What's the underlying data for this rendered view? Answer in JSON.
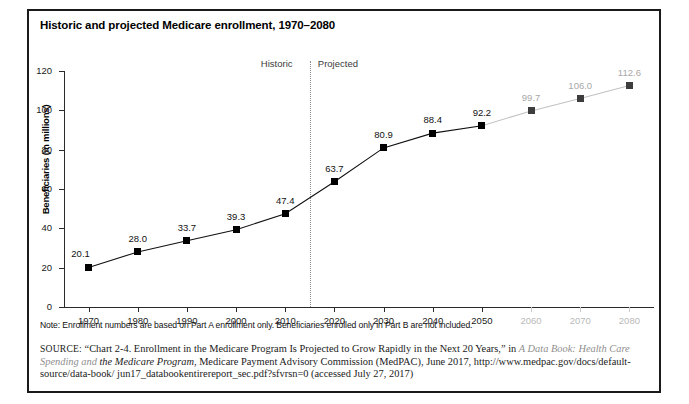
{
  "figure": {
    "title": "Historic and projected Medicare enrollment, 1970–2080",
    "note": "Note: Enrollment numbers are based on Part A enrollment only. Beneficiaries enrolled only in Part B are not included.",
    "source": {
      "label": "SOURCE:",
      "line1": "“Chart 2-4. Enrollment in the Medicare Program Is Projected to Grow Rapidly in the Next 20 Years,” in",
      "italic1": "A Data Book: Health Care Spending and",
      "italic2": "the Medicare Program",
      "line2": ", Medicare Payment Advisory Commission (MedPAC), June 2017, http://www.medpac.gov/docs/default-source/data-book/",
      "line3": "jun17_databookentirereport_sec.pdf?sfvrsn=0 (accessed July 27, 2017)"
    }
  },
  "annotations": {
    "historic": "Historic",
    "projected": "Projected",
    "divider_year": 2015
  },
  "chart_data": {
    "type": "line",
    "title": "Historic and projected Medicare enrollment, 1970–2080",
    "xlabel": "",
    "ylabel": "Beneficiaries (in millions)",
    "xlim": [
      1965,
      2085
    ],
    "ylim": [
      0,
      120
    ],
    "grid": false,
    "legend": "none",
    "xticks": [
      1970,
      1980,
      1990,
      2000,
      2010,
      2020,
      2030,
      2040,
      2050,
      2060,
      2070,
      2080
    ],
    "xticklabels": [
      "1970",
      "1980",
      "1990",
      "2000",
      "2010",
      "2020",
      "2030",
      "2040",
      "2050",
      "2060",
      "2070",
      "2080"
    ],
    "yticks": [
      0,
      20,
      40,
      60,
      80,
      100,
      120
    ],
    "yticklabels": [
      "0",
      "20",
      "40",
      "60",
      "80",
      "100",
      "120"
    ],
    "x": [
      1970,
      1980,
      1990,
      2000,
      2010,
      2020,
      2030,
      2040,
      2050,
      2060,
      2070,
      2080
    ],
    "values": [
      20.1,
      28.0,
      33.7,
      39.3,
      47.4,
      63.7,
      80.9,
      88.4,
      92.2,
      99.7,
      106.0,
      112.6
    ],
    "point_labels": [
      "20.1",
      "28.0",
      "33.7",
      "39.3",
      "47.4",
      "63.7",
      "80.9",
      "88.4",
      "92.2",
      "99.7",
      "106.0",
      "112.6"
    ]
  }
}
